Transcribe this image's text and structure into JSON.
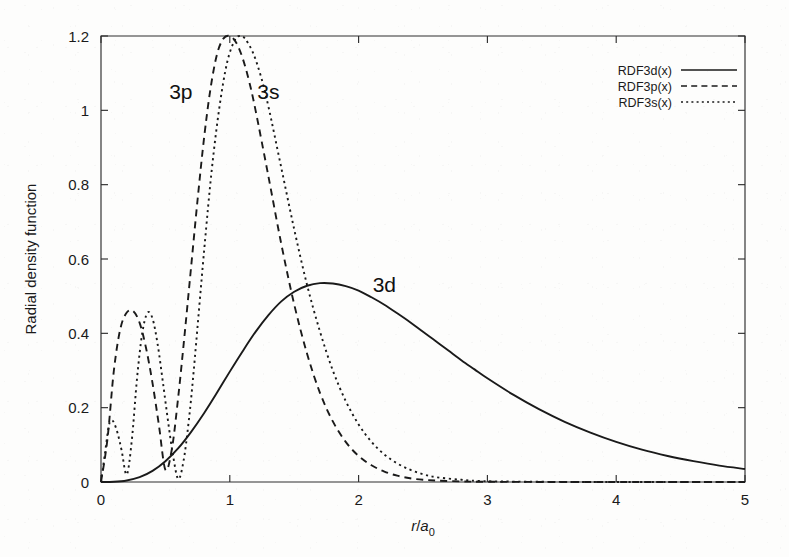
{
  "chart_data": {
    "type": "line",
    "title": "",
    "xlabel": "r/a0",
    "xlabel_parts": {
      "numerator": "r",
      "denominator": "a",
      "subscript": "0"
    },
    "ylabel": "Radial density function",
    "xlim": [
      0,
      5
    ],
    "ylim": [
      0,
      1.2
    ],
    "xticks": [
      "0",
      "1",
      "2",
      "3",
      "4",
      "5"
    ],
    "xtick_values": [
      0,
      1,
      2,
      3,
      4,
      5
    ],
    "yticks": [
      "0",
      "0.2",
      "0.4",
      "0.6",
      "0.8",
      "1",
      "1.2"
    ],
    "ytick_values": [
      0,
      0.2,
      0.4,
      0.6,
      0.8,
      1,
      1.2
    ],
    "grid": false,
    "legend_position": "top-right",
    "legend": [
      {
        "label": "RDF3d(x)",
        "style": "solid"
      },
      {
        "label": "RDF3p(x)",
        "style": "dashed"
      },
      {
        "label": "RDF3s(x)",
        "style": "dotted"
      }
    ],
    "annotations": [
      {
        "text": "3p",
        "x": 0.62,
        "y": 1.03
      },
      {
        "text": "3s",
        "x": 1.3,
        "y": 1.03
      },
      {
        "text": "3d",
        "x": 2.2,
        "y": 0.51
      }
    ],
    "series": [
      {
        "name": "RDF3d(x)",
        "style": "solid",
        "label": "3d",
        "peak": {
          "x": 1.78,
          "y": 0.535
        },
        "nodes": [
          0
        ],
        "x": [
          0,
          0.1,
          0.2,
          0.3,
          0.4,
          0.5,
          0.6,
          0.7,
          0.8,
          0.9,
          1,
          1.1,
          1.2,
          1.3,
          1.4,
          1.5,
          1.6,
          1.7,
          1.8,
          1.9,
          2,
          2.1,
          2.2,
          2.3,
          2.4,
          2.5,
          2.6,
          2.7,
          2.8,
          2.9,
          3,
          3.2,
          3.4,
          3.6,
          3.8,
          4,
          4.2,
          4.4,
          4.6,
          4.8,
          5
        ],
        "y": [
          0,
          0.0005,
          0.004,
          0.013,
          0.03,
          0.056,
          0.091,
          0.135,
          0.185,
          0.24,
          0.297,
          0.352,
          0.404,
          0.449,
          0.486,
          0.512,
          0.528,
          0.535,
          0.534,
          0.527,
          0.515,
          0.497,
          0.477,
          0.454,
          0.43,
          0.404,
          0.379,
          0.353,
          0.327,
          0.303,
          0.279,
          0.235,
          0.196,
          0.162,
          0.133,
          0.108,
          0.087,
          0.07,
          0.056,
          0.044,
          0.035
        ]
      },
      {
        "name": "RDF3p(x)",
        "style": "dashed",
        "label": "3p",
        "peaks": [
          {
            "x": 0.27,
            "y": 0.47
          },
          {
            "x": 0.99,
            "y": 1.2
          }
        ],
        "nodes": [
          0,
          0.5
        ],
        "x": [
          0,
          0.05,
          0.1,
          0.15,
          0.2,
          0.25,
          0.3,
          0.35,
          0.4,
          0.45,
          0.5,
          0.55,
          0.6,
          0.65,
          0.7,
          0.75,
          0.8,
          0.85,
          0.9,
          0.95,
          1,
          1.05,
          1.1,
          1.15,
          1.2,
          1.3,
          1.4,
          1.5,
          1.6,
          1.7,
          1.8,
          1.9,
          2,
          2.1,
          2.2,
          2.3,
          2.4,
          2.5,
          2.6,
          2.8,
          3,
          3.5,
          4,
          4.5,
          5
        ],
        "y": [
          0,
          0.115,
          0.3,
          0.412,
          0.456,
          0.46,
          0.428,
          0.36,
          0.266,
          0.152,
          0.033,
          0.088,
          0.23,
          0.4,
          0.58,
          0.76,
          0.925,
          1.058,
          1.15,
          1.193,
          1.2,
          1.182,
          1.14,
          1.078,
          1.0,
          0.822,
          0.64,
          0.478,
          0.345,
          0.24,
          0.163,
          0.108,
          0.07,
          0.045,
          0.028,
          0.017,
          0.01,
          0.006,
          0.004,
          0.0015,
          0.0006,
          0.0001,
          0,
          0,
          0
        ]
      },
      {
        "name": "RDF3s(x)",
        "style": "dotted",
        "label": "3s",
        "peaks": [
          {
            "x": 0.08,
            "y": 0.165
          },
          {
            "x": 0.37,
            "y": 0.455
          },
          {
            "x": 1.08,
            "y": 1.2
          }
        ],
        "nodes": [
          0,
          0.2,
          0.62
        ],
        "x": [
          0,
          0.03,
          0.06,
          0.08,
          0.1,
          0.13,
          0.16,
          0.2,
          0.24,
          0.28,
          0.32,
          0.36,
          0.4,
          0.44,
          0.48,
          0.52,
          0.56,
          0.6,
          0.64,
          0.68,
          0.72,
          0.8,
          0.86,
          0.92,
          0.98,
          1.04,
          1.08,
          1.12,
          1.18,
          1.24,
          1.3,
          1.4,
          1.5,
          1.6,
          1.7,
          1.8,
          1.9,
          2,
          2.1,
          2.2,
          2.3,
          2.4,
          2.5,
          2.6,
          2.8,
          3,
          3.5,
          4,
          4.5,
          5
        ],
        "y": [
          0,
          0.075,
          0.15,
          0.165,
          0.16,
          0.13,
          0.085,
          0.02,
          0.115,
          0.28,
          0.4,
          0.455,
          0.44,
          0.37,
          0.27,
          0.165,
          0.07,
          0.008,
          0.055,
          0.16,
          0.3,
          0.62,
          0.84,
          1.01,
          1.13,
          1.19,
          1.2,
          1.192,
          1.155,
          1.093,
          1.01,
          0.845,
          0.68,
          0.53,
          0.405,
          0.3,
          0.218,
          0.155,
          0.108,
          0.074,
          0.05,
          0.033,
          0.021,
          0.013,
          0.006,
          0.002,
          0.0004,
          0,
          0,
          0
        ]
      }
    ]
  },
  "figure": {
    "plot_area": {
      "left": 101,
      "top": 36,
      "right": 745,
      "bottom": 482
    },
    "background_color": "#fdfdfc",
    "line_color": "#1a1a1a",
    "axis_color": "#2e2e2e"
  }
}
